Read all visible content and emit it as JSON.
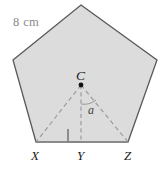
{
  "figure": {
    "type": "geometry-diagram",
    "shape": "regular-pentagon",
    "colors": {
      "fill": "#dcdcdc",
      "outline": "#595959",
      "dashed": "#9a9a9a",
      "side_label": "#8a8a8a",
      "point_label": "#1a1a1a",
      "right_angle": "#595959",
      "background": "#ffffff"
    },
    "side_length_label": "8 cm",
    "center_label": "C",
    "apothem_label": "a",
    "vertex_labels": {
      "left": "X",
      "mid": "Y",
      "right": "Z"
    },
    "geometry": {
      "pentagon_vertices": [
        [
          81,
          5
        ],
        [
          157,
          60
        ],
        [
          128,
          142
        ],
        [
          36,
          142
        ],
        [
          13,
          60
        ]
      ],
      "center": [
        81,
        85
      ],
      "foot_of_apothem": [
        81,
        142
      ],
      "right_angle_marker": [
        68,
        129,
        13,
        13
      ],
      "labeled_side_endpoints": [
        [
          13,
          60
        ],
        [
          81,
          5
        ]
      ]
    }
  }
}
